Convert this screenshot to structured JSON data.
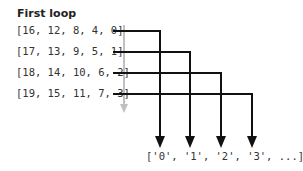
{
  "title": "First loop",
  "rows": [
    "[16, 12, 8, 4, 0]",
    "[17, 13, 9, 5, 1]",
    "[18, 14, 10, 6, 2]",
    "[19, 15, 11, 7, 3]"
  ],
  "output": "['0', '1', '2', '3', ...]",
  "colors": {
    "line": "#111111",
    "gray_arrow": "#c0c0c0"
  }
}
